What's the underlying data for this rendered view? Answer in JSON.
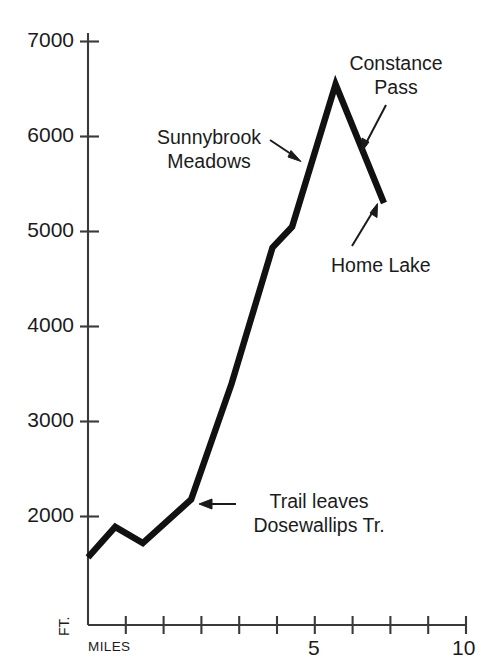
{
  "chart_data": {
    "type": "line",
    "title": "",
    "subtitle": "",
    "xlabel": "MILES",
    "ylabel": "FT.",
    "xlim": [
      0,
      10
    ],
    "ylim": [
      0,
      7000
    ],
    "grid": false,
    "legend": "none",
    "series": [
      {
        "name": "Trail elevation profile",
        "x": [
          0.0,
          0.72,
          1.45,
          2.73,
          3.8,
          4.88,
          5.4,
          6.55,
          7.83
        ],
        "values": [
          1570,
          1890,
          1720,
          2180,
          3400,
          4830,
          5050,
          6550,
          5300
        ]
      }
    ],
    "x_ticks": [
      0,
      1,
      2,
      3,
      4,
      5,
      6,
      7,
      8,
      9,
      10
    ],
    "x_tick_labels": [
      "MILES",
      "",
      "",
      "",
      "",
      "5",
      "",
      "",
      "",
      "",
      "10"
    ],
    "y_ticks": [
      2000,
      3000,
      4000,
      5000,
      6000,
      7000
    ],
    "y_tick_labels": [
      "2000",
      "3000",
      "4000",
      "5000",
      "6000",
      "7000"
    ],
    "annotations": [
      {
        "id": "sunnybrook-meadows",
        "lines": [
          "Sunnybrook",
          "Meadows"
        ],
        "points_to_x": 3.55,
        "points_to_y": 3180
      },
      {
        "id": "constance-pass",
        "lines": [
          "Constance",
          "Pass"
        ],
        "points_to_x": 6.75,
        "points_to_y": 6280
      },
      {
        "id": "home-lake",
        "lines": [
          "Home Lake"
        ],
        "points_to_x": 7.7,
        "points_to_y": 5420
      },
      {
        "id": "trail-leaves-dosewallips",
        "lines": [
          "Trail leaves",
          "Dosewallips Tr."
        ],
        "points_to_x": 2.85,
        "points_to_y": 2220
      }
    ],
    "colors": {
      "line": "#111111",
      "axis": "#3a3a3a",
      "text": "#1b1b1b",
      "background": "#ffffff"
    }
  },
  "y_axis": {
    "unit": "FT.",
    "labels": [
      "7000",
      "6000",
      "5000",
      "4000",
      "3000",
      "2000"
    ]
  },
  "x_axis": {
    "unit": "MILES",
    "labels": [
      "5",
      "10"
    ]
  },
  "annotations": {
    "sunnybrook": {
      "line1": "Sunnybrook",
      "line2": "Meadows"
    },
    "constance": {
      "line1": "Constance",
      "line2": "Pass"
    },
    "home_lake": {
      "line1": "Home Lake"
    },
    "trail_leaves": {
      "line1": "Trail leaves",
      "line2": "Dosewallips Tr."
    }
  }
}
